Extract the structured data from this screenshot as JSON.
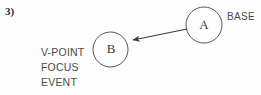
{
  "figure": {
    "item_number": "3)",
    "background_color": "#fdfdfd",
    "stroke_color": "#4a4a4a",
    "text_color": "#4a4a4a"
  },
  "nodes": [
    {
      "id": "node-a",
      "letter": "A",
      "cx": 204,
      "cy": 25,
      "r": 18
    },
    {
      "id": "node-b",
      "letter": "B",
      "cx": 110.5,
      "cy": 49.5,
      "r": 17.5
    }
  ],
  "edges": [
    {
      "id": "edge-a-to-b",
      "from": "node-a",
      "to": "node-b",
      "arrow_head": "to",
      "x1": 187,
      "y1": 29,
      "x2": 130,
      "y2": 40
    }
  ],
  "labels": {
    "base": "BASE",
    "stack": [
      "V-POINT",
      "FOCUS",
      "EVENT"
    ]
  }
}
